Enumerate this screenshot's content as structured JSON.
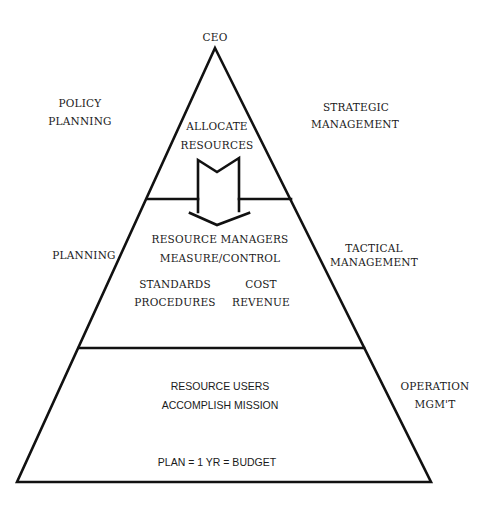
{
  "diagram": {
    "type": "management-pyramid",
    "apex_label": "CEO",
    "left_labels": {
      "top": [
        "POLICY",
        "PLANNING"
      ],
      "middle": [
        "PLANNING"
      ]
    },
    "right_labels": {
      "top": [
        "STRATEGIC",
        "MANAGEMENT"
      ],
      "middle": [
        "TACTICAL",
        "MANAGEMENT"
      ],
      "bottom": [
        "OPERATION",
        "MGM'T"
      ]
    },
    "tiers": [
      {
        "name": "strategic",
        "lines": [
          "ALLOCATE",
          "RESOURCES"
        ]
      },
      {
        "name": "tactical",
        "lines": [
          "RESOURCE MANAGERS",
          "MEASURE/CONTROL"
        ],
        "columns": [
          [
            "STANDARDS",
            "PROCEDURES"
          ],
          [
            "COST",
            "REVENUE"
          ]
        ]
      },
      {
        "name": "operational",
        "lines": [
          "RESOURCE USERS",
          "ACCOMPLISH MISSION"
        ],
        "footer": "PLAN = 1 YR = BUDGET"
      }
    ],
    "arrow": {
      "direction": "down",
      "meaning": "allocate-resources-flow"
    }
  }
}
